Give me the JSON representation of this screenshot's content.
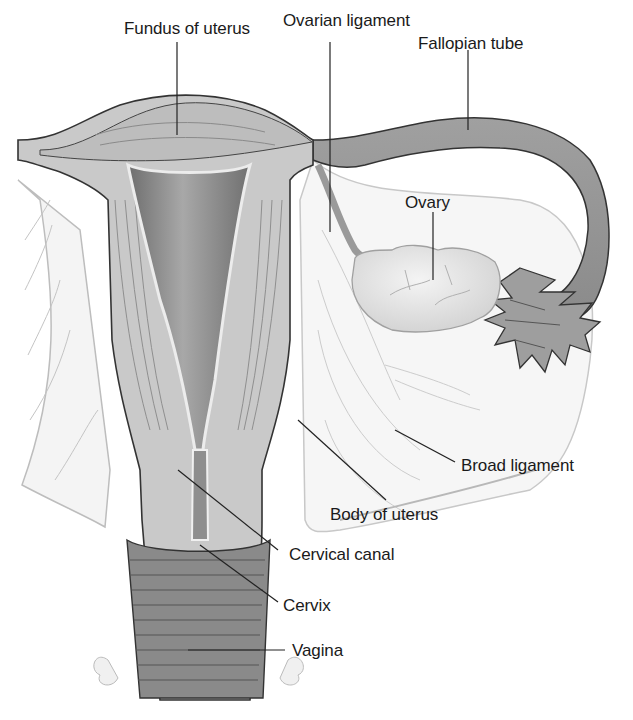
{
  "figure": {
    "colors": {
      "background": "#ffffff",
      "tissue_light": "#d9d9d9",
      "tissue_mid": "#b8b8b8",
      "tissue_dark": "#8c8c8c",
      "cavity": "#7a7a7a",
      "ligament": "#f2f2f2",
      "outline": "#333333",
      "leader_line": "#222222",
      "label_text": "#1a1a1a"
    },
    "labels": [
      {
        "id": "fundus",
        "text": "Fundus of uterus"
      },
      {
        "id": "ovarian_ligament",
        "text": "Ovarian ligament"
      },
      {
        "id": "fallopian_tube",
        "text": "Fallopian tube"
      },
      {
        "id": "ovary",
        "text": "Ovary"
      },
      {
        "id": "broad_ligament",
        "text": "Broad ligament"
      },
      {
        "id": "body_of_uterus",
        "text": "Body of uterus"
      },
      {
        "id": "cervical_canal",
        "text": "Cervical canal"
      },
      {
        "id": "cervix",
        "text": "Cervix"
      },
      {
        "id": "vagina",
        "text": "Vagina"
      }
    ]
  }
}
